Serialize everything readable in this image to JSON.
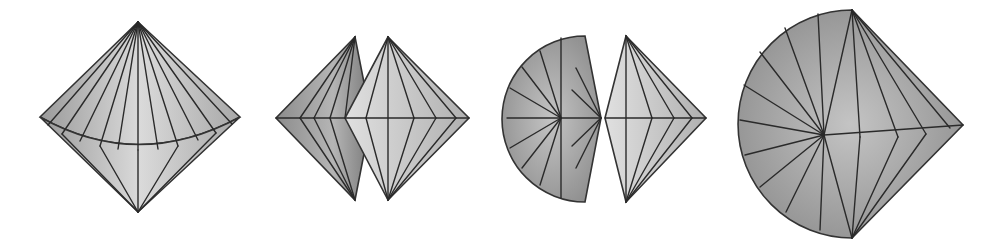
{
  "figure": {
    "panels": [
      {
        "id": 1,
        "label": "bicone-front-view"
      },
      {
        "id": 2,
        "label": "two-overlapping-bicones"
      },
      {
        "id": 3,
        "label": "fan-and-half-bicone"
      },
      {
        "id": 4,
        "label": "unfolded-fan-cone"
      }
    ],
    "colors": {
      "background": "#ffffff",
      "face_light": "#d8d8d8",
      "face_mid": "#b9b9b9",
      "face_dark": "#8f8f8f",
      "edge": "#2a2a2a"
    }
  }
}
